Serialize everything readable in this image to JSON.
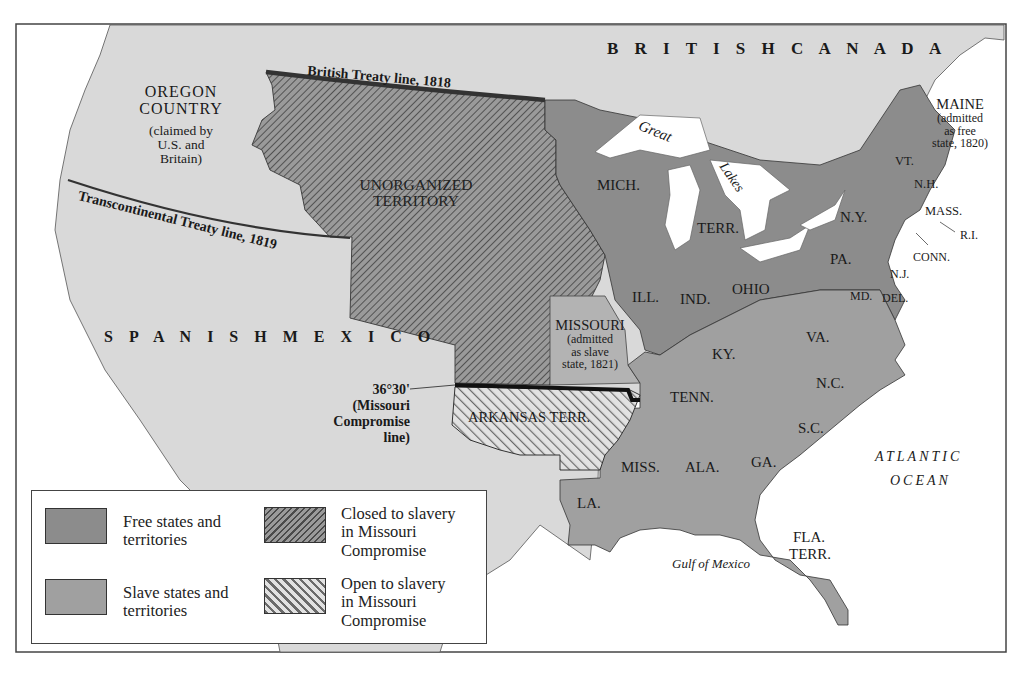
{
  "colors": {
    "free": "#8c8c8c",
    "slave": "#a0a0a0",
    "missouri": "#b3b3b3",
    "foreign": "#d9d9d9",
    "water": "#ffffff",
    "hatch_line": "#555555",
    "compromise_line": "#111111",
    "treaty_line": "#333333"
  },
  "regions": {
    "british_canada": "B R I T I S H   C A N A D A",
    "oregon": {
      "title1": "OREGON",
      "title2": "COUNTRY",
      "note1": "(claimed by",
      "note2": "U.S. and",
      "note3": "Britain)"
    },
    "unorganized": {
      "line1": "UNORGANIZED",
      "line2": "TERRITORY"
    },
    "spanish_mexico": "S P A N I S H   M E X I C O",
    "missouri": {
      "title": "MISSOURI",
      "note1": "(admitted",
      "note2": "as slave",
      "note3": "state, 1821)"
    },
    "maine": {
      "title": "MAINE",
      "note1": "(admitted",
      "note2": "as free",
      "note3": "state, 1820)"
    },
    "arkansas": "ARKANSAS TERR.",
    "atlantic1": "ATLANTIC",
    "atlantic2": "OCEAN",
    "gulf": "Gulf of Mexico",
    "great": "Great",
    "lakes": "Lakes"
  },
  "lines": {
    "british_treaty": "British Treaty line, 1818",
    "transcontinental": "Transcontinental Treaty line, 1819",
    "compromise": {
      "l1": "36°30'",
      "l2": "(Missouri",
      "l3": "Compromise",
      "l4": "line)"
    }
  },
  "states": {
    "mich": "MICH.",
    "terr": "TERR.",
    "ill": "ILL.",
    "ind": "IND.",
    "ohio": "OHIO",
    "ny": "N.Y.",
    "pa": "PA.",
    "vt": "VT.",
    "nh": "N.H.",
    "mass": "MASS.",
    "ri": "R.I.",
    "conn": "CONN.",
    "nj": "N.J.",
    "md": "MD.",
    "del": "DEL.",
    "va": "VA.",
    "ky": "KY.",
    "tenn": "TENN.",
    "nc": "N.C.",
    "sc": "S.C.",
    "ga": "GA.",
    "ala": "ALA.",
    "miss": "MISS.",
    "la": "LA.",
    "fla1": "FLA.",
    "fla2": "TERR."
  },
  "legend": {
    "free": {
      "l1": "Free states and",
      "l2": "territories"
    },
    "slave": {
      "l1": "Slave states and",
      "l2": "territories"
    },
    "closed": {
      "l1": "Closed to slavery",
      "l2": "in Missouri",
      "l3": "Compromise"
    },
    "open": {
      "l1": "Open to slavery",
      "l2": "in Missouri",
      "l3": "Compromise"
    }
  }
}
